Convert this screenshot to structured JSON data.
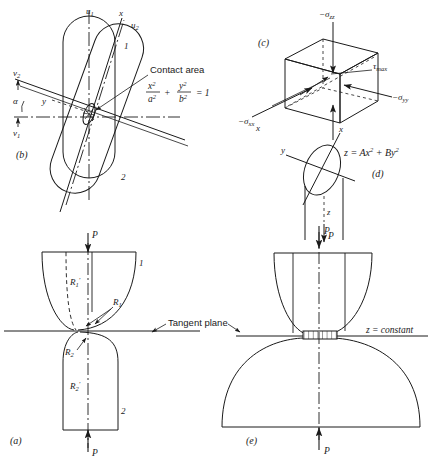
{
  "figure": {
    "title_caption": "",
    "panels": [
      {
        "key": "b",
        "label": "(b)",
        "description": "Two crossed cylinders in plan view with contact ellipse",
        "axes": [
          "u1",
          "x",
          "u2",
          "v2",
          "y",
          "v1"
        ],
        "angle_label": "α",
        "body_labels": [
          "1",
          "2"
        ],
        "annotation": "Contact area",
        "equation": {
          "num1": "x",
          "den1": "a",
          "num2": "y",
          "den2": "b",
          "plus": "+",
          "equals": "= 1",
          "sup": "2"
        }
      },
      {
        "key": "c",
        "label": "(c)",
        "description": "Stress element cube with principal stresses",
        "stress_zz": "−σ",
        "stress_zz_sub": "zz",
        "stress_xx": "−σ",
        "stress_xx_sub": "xx",
        "stress_yy": "−σ",
        "stress_yy_sub": "yy",
        "tau": "τ",
        "tau_sub": "max",
        "axis_x": "x"
      },
      {
        "key": "d",
        "label": "(d)",
        "description": "Contact ellipse in x-y plane with paraboloid surface equation",
        "axis_x": "x",
        "axis_y": "y",
        "axis_z": "z",
        "equation": "z  =  Ax²  +  By²",
        "force": "P"
      },
      {
        "key": "a",
        "label": "(a)",
        "description": "Two curved bodies in contact along a tangent plane",
        "force_top": "P",
        "force_bottom": "P",
        "radius_r1p": "R",
        "radius_r1p_sub": "1",
        "radius_r1": "R",
        "radius_r1_sub": "1",
        "radius_r2": "R",
        "radius_r2_sub": "2",
        "radius_r2p": "R",
        "radius_r2p_sub": "2",
        "prime": "′",
        "body_labels": [
          "1",
          "2"
        ],
        "tangent_plane": "Tangent plane"
      },
      {
        "key": "e",
        "label": "(e)",
        "description": "Deformed contact region between two bodies under load P",
        "force_top": "P",
        "force_bottom": "P",
        "contact_note": "z  =  constant"
      }
    ],
    "colors": {
      "ink": "#1a1a1a",
      "background": "#ffffff"
    }
  }
}
